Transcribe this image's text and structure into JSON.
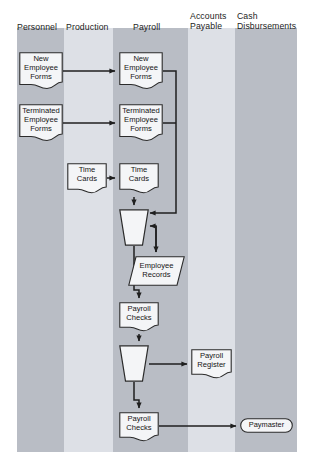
{
  "diagram": {
    "type": "swimlane-flowchart",
    "canvas": {
      "width": 316,
      "height": 468
    },
    "colors": {
      "band_dark": "#b9bdc5",
      "band_light": "#dde0e6",
      "node_fill": "#f4f5f7",
      "node_stroke": "#2b2b2b",
      "line": "#1f1f1f",
      "text": "#141414",
      "page": "#ffffff"
    },
    "columns": [
      {
        "id": "personnel",
        "label": "Personnel",
        "shade": "dark",
        "x": 17,
        "width": 47,
        "header_x": 17,
        "header_y": 22
      },
      {
        "id": "production",
        "label": "Production",
        "shade": "light",
        "x": 64,
        "width": 49,
        "header_x": 66,
        "header_y": 22
      },
      {
        "id": "payroll",
        "label": "Payroll",
        "shade": "dark",
        "x": 113,
        "width": 75,
        "header_x": 133,
        "header_y": 22
      },
      {
        "id": "accounts_payable",
        "label": "Accounts\nPayable",
        "shade": "light",
        "x": 188,
        "width": 47,
        "header_x": 190,
        "header_y": 11
      },
      {
        "id": "cash_disbursements",
        "label": "Cash\nDisbursements",
        "shade": "dark",
        "x": 235,
        "width": 62,
        "header_x": 237,
        "header_y": 11
      }
    ],
    "nodes": [
      {
        "id": "n1",
        "shape": "document",
        "label": "New\nEmployee\nForms",
        "column": "personnel",
        "x": 19,
        "y": 52,
        "w": 44,
        "h": 38
      },
      {
        "id": "n2",
        "shape": "document",
        "label": "New\nEmployee\nForms",
        "column": "payroll",
        "x": 119,
        "y": 52,
        "w": 44,
        "h": 38
      },
      {
        "id": "n3",
        "shape": "document",
        "label": "Terminated\nEmployee\nForms",
        "column": "personnel",
        "x": 19,
        "y": 104,
        "w": 44,
        "h": 38
      },
      {
        "id": "n4",
        "shape": "document",
        "label": "Terminated\nEmployee\nForms",
        "column": "payroll",
        "x": 119,
        "y": 104,
        "w": 44,
        "h": 38
      },
      {
        "id": "n5",
        "shape": "document",
        "label": "Time\nCards",
        "column": "production",
        "x": 67,
        "y": 163,
        "w": 40,
        "h": 31
      },
      {
        "id": "n6",
        "shape": "document",
        "label": "Time\nCards",
        "column": "payroll",
        "x": 119,
        "y": 163,
        "w": 40,
        "h": 31
      },
      {
        "id": "n7",
        "shape": "manual-op",
        "label": "",
        "column": "payroll",
        "x": 119,
        "y": 209,
        "w": 30,
        "h": 37
      },
      {
        "id": "n8",
        "shape": "parallelogram",
        "label": "Employee\nRecords",
        "column": "payroll",
        "x": 128,
        "y": 256,
        "w": 57,
        "h": 30
      },
      {
        "id": "n9",
        "shape": "document",
        "label": "Payroll\nChecks",
        "column": "payroll",
        "x": 119,
        "y": 302,
        "w": 40,
        "h": 30
      },
      {
        "id": "n10",
        "shape": "manual-op",
        "label": "",
        "column": "payroll",
        "x": 119,
        "y": 345,
        "w": 30,
        "h": 37
      },
      {
        "id": "n11",
        "shape": "document",
        "label": "Payroll\nRegister",
        "column": "accounts_payable",
        "x": 191,
        "y": 349,
        "w": 41,
        "h": 30
      },
      {
        "id": "n12",
        "shape": "document",
        "label": "Payroll\nChecks",
        "column": "payroll",
        "x": 119,
        "y": 412,
        "w": 40,
        "h": 30
      },
      {
        "id": "n13",
        "shape": "terminator",
        "label": "Paymaster",
        "column": "cash_disbursements",
        "x": 240,
        "y": 418,
        "w": 53,
        "h": 15
      }
    ],
    "connectors": [
      {
        "id": "c1",
        "from": "n1",
        "to": "n2",
        "label": ""
      },
      {
        "id": "c2",
        "from": "n3",
        "to": "n4",
        "label": ""
      },
      {
        "id": "c3",
        "from": "n5",
        "to": "n6",
        "label": ""
      },
      {
        "id": "c4",
        "from": "n2",
        "to": "n7",
        "label": ""
      },
      {
        "id": "c5",
        "from": "n4",
        "to": "n7",
        "label": ""
      },
      {
        "id": "c6",
        "from": "n6",
        "to": "n7",
        "label": ""
      },
      {
        "id": "c7",
        "from": "n7",
        "to": "n8",
        "label": ""
      },
      {
        "id": "c8",
        "from": "n8",
        "to": "n7",
        "label": ""
      },
      {
        "id": "c9",
        "from": "n7",
        "to": "n9",
        "label": ""
      },
      {
        "id": "c10",
        "from": "n9",
        "to": "n10",
        "label": ""
      },
      {
        "id": "c11",
        "from": "n10",
        "to": "n11",
        "label": ""
      },
      {
        "id": "c12",
        "from": "n10",
        "to": "n12",
        "label": ""
      },
      {
        "id": "c13",
        "from": "n12",
        "to": "n13",
        "label": ""
      }
    ]
  }
}
